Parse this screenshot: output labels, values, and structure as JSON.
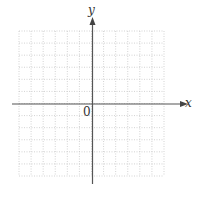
{
  "chart_data": {
    "type": "line",
    "title": "",
    "xlabel": "x",
    "ylabel": "y",
    "origin_label": "0",
    "series": [],
    "grid": true,
    "grid_style": "dotted",
    "grid_cells": {
      "columns": 12,
      "rows": 12
    },
    "xlim": [
      -6,
      6
    ],
    "ylim": [
      -6,
      6
    ],
    "tick_labels": {
      "x": [],
      "y": []
    },
    "legend": null
  },
  "colors": {
    "axis": "#555555",
    "grid": "#c8c8c8",
    "background": "#ffffff"
  }
}
